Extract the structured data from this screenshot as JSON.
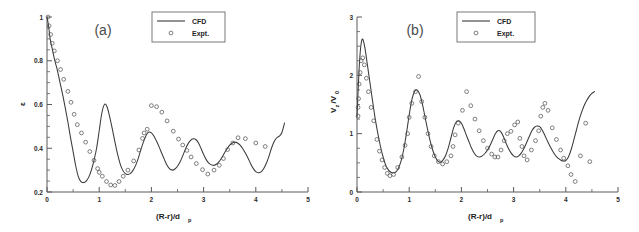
{
  "figure": {
    "title": "",
    "panels": [
      "a",
      "b"
    ]
  },
  "panel_a": {
    "label": "(a)",
    "legend": {
      "cfd_label": "CFD",
      "expt_label": "Expt."
    },
    "xlabel_main": "(R-r)/d",
    "xlabel_sub": "p",
    "ylabel": "ε"
  },
  "panel_b": {
    "label": "(b)",
    "legend": {
      "cfd_label": "CFD",
      "expt_label": "Expt."
    },
    "xlabel_main": "(R-r)/d",
    "xlabel_sub": "p",
    "ylabel_main": "V",
    "ylabel_sub1": "z",
    "ylabel_mid": "/V",
    "ylabel_sub2": "0"
  },
  "colors": {
    "curve": "#3a3a3a",
    "marker": "#555555",
    "axis": "#5a5a5a",
    "background": "#ffffff",
    "text": "#1f1f1f"
  },
  "chart_data": [
    {
      "type": "line",
      "panel": "a",
      "title": "(a)",
      "xlabel": "(R-r)/dp",
      "ylabel": "ε",
      "xlim": [
        0,
        5
      ],
      "ylim": [
        0.2,
        1.0
      ],
      "xticks": [
        0,
        1,
        2,
        3,
        4,
        5
      ],
      "yticks": [
        0.2,
        0.4,
        0.6,
        0.8,
        1.0
      ],
      "xticklabels": [
        "0",
        "1",
        "2",
        "3",
        "4",
        "5"
      ],
      "yticklabels": [
        "0.2",
        "0.4",
        "0.6",
        "0.8",
        "1"
      ],
      "xminor_step": 0.25,
      "yminor_step": 0.05,
      "grid": false,
      "legend_position": "top-right",
      "series": [
        {
          "name": "CFD",
          "style": "line",
          "x": [
            0.0,
            0.03,
            0.06,
            0.1,
            0.15,
            0.2,
            0.25,
            0.3,
            0.35,
            0.4,
            0.45,
            0.5,
            0.55,
            0.6,
            0.65,
            0.7,
            0.75,
            0.8,
            0.85,
            0.9,
            0.95,
            1.0,
            1.05,
            1.1,
            1.15,
            1.2,
            1.25,
            1.3,
            1.35,
            1.4,
            1.45,
            1.5,
            1.55,
            1.6,
            1.65,
            1.7,
            1.75,
            1.8,
            1.85,
            1.9,
            1.95,
            2.0,
            2.05,
            2.1,
            2.15,
            2.2,
            2.25,
            2.3,
            2.35,
            2.4,
            2.45,
            2.5,
            2.55,
            2.6,
            2.65,
            2.7,
            2.75,
            2.8,
            2.85,
            2.9,
            2.95,
            3.0,
            3.05,
            3.1,
            3.15,
            3.2,
            3.25,
            3.3,
            3.35,
            3.4,
            3.45,
            3.5,
            3.55,
            3.6,
            3.65,
            3.7,
            3.75,
            3.8,
            3.85,
            3.9,
            3.95,
            4.0,
            4.05,
            4.1,
            4.15,
            4.2,
            4.25,
            4.3,
            4.35,
            4.4,
            4.45,
            4.5,
            4.55
          ],
          "y": [
            1.0,
            0.96,
            0.9,
            0.855,
            0.8,
            0.755,
            0.7,
            0.645,
            0.585,
            0.52,
            0.45,
            0.385,
            0.32,
            0.27,
            0.247,
            0.243,
            0.25,
            0.268,
            0.3,
            0.345,
            0.4,
            0.48,
            0.56,
            0.6,
            0.59,
            0.545,
            0.49,
            0.43,
            0.375,
            0.33,
            0.3,
            0.284,
            0.28,
            0.285,
            0.3,
            0.323,
            0.355,
            0.395,
            0.43,
            0.46,
            0.474,
            0.47,
            0.455,
            0.432,
            0.405,
            0.376,
            0.348,
            0.322,
            0.306,
            0.3,
            0.305,
            0.318,
            0.338,
            0.365,
            0.395,
            0.42,
            0.436,
            0.443,
            0.44,
            0.425,
            0.4,
            0.372,
            0.348,
            0.332,
            0.324,
            0.322,
            0.328,
            0.34,
            0.358,
            0.378,
            0.398,
            0.414,
            0.424,
            0.428,
            0.424,
            0.414,
            0.398,
            0.378,
            0.355,
            0.33,
            0.308,
            0.293,
            0.288,
            0.292,
            0.306,
            0.33,
            0.362,
            0.4,
            0.43,
            0.448,
            0.455,
            0.472,
            0.515
          ]
        },
        {
          "name": "Expt.",
          "style": "markers",
          "x": [
            0.02,
            0.04,
            0.07,
            0.1,
            0.14,
            0.2,
            0.26,
            0.32,
            0.4,
            0.46,
            0.52,
            0.58,
            0.66,
            0.74,
            0.82,
            0.9,
            0.97,
            1.0,
            1.06,
            1.14,
            1.22,
            1.3,
            1.38,
            1.46,
            1.55,
            1.66,
            1.76,
            1.83,
            1.86,
            1.92,
            2.0,
            2.1,
            2.2,
            2.3,
            2.42,
            2.52,
            2.6,
            2.68,
            2.76,
            2.86,
            2.98,
            3.08,
            3.2,
            3.3,
            3.38,
            3.46,
            3.56,
            3.66,
            3.8,
            4.0,
            4.18
          ],
          "y": [
            1.0,
            0.96,
            0.92,
            0.88,
            0.845,
            0.8,
            0.76,
            0.715,
            0.66,
            0.61,
            0.555,
            0.508,
            0.47,
            0.428,
            0.385,
            0.345,
            0.307,
            0.29,
            0.272,
            0.248,
            0.232,
            0.23,
            0.248,
            0.272,
            0.3,
            0.342,
            0.392,
            0.445,
            0.47,
            0.487,
            0.595,
            0.59,
            0.565,
            0.525,
            0.478,
            0.442,
            0.415,
            0.39,
            0.36,
            0.33,
            0.302,
            0.282,
            0.3,
            0.322,
            0.353,
            0.394,
            0.424,
            0.448,
            0.444,
            0.424,
            0.408
          ]
        }
      ]
    },
    {
      "type": "line",
      "panel": "b",
      "title": "(b)",
      "xlabel": "(R-r)/dp",
      "ylabel": "Vz/V0",
      "xlim": [
        0,
        5
      ],
      "ylim": [
        0,
        3
      ],
      "xticks": [
        0,
        1,
        2,
        3,
        4,
        5
      ],
      "yticks": [
        0,
        1,
        2,
        3
      ],
      "xticklabels": [
        "0",
        "1",
        "2",
        "3",
        "4",
        "5"
      ],
      "yticklabels": [
        "0",
        "1",
        "2",
        "3"
      ],
      "xminor_step": 0.25,
      "yminor_step": 0.25,
      "grid": false,
      "legend_position": "top-right",
      "series": [
        {
          "name": "CFD",
          "style": "line",
          "x": [
            0.0,
            0.02,
            0.04,
            0.06,
            0.08,
            0.1,
            0.12,
            0.15,
            0.18,
            0.22,
            0.26,
            0.3,
            0.35,
            0.4,
            0.45,
            0.5,
            0.55,
            0.6,
            0.65,
            0.7,
            0.75,
            0.8,
            0.85,
            0.9,
            0.95,
            1.0,
            1.05,
            1.1,
            1.15,
            1.2,
            1.25,
            1.3,
            1.35,
            1.4,
            1.45,
            1.5,
            1.55,
            1.6,
            1.65,
            1.7,
            1.75,
            1.8,
            1.85,
            1.9,
            1.95,
            2.0,
            2.05,
            2.1,
            2.15,
            2.2,
            2.25,
            2.3,
            2.35,
            2.4,
            2.45,
            2.5,
            2.55,
            2.6,
            2.65,
            2.7,
            2.75,
            2.8,
            2.85,
            2.9,
            2.95,
            3.0,
            3.05,
            3.1,
            3.15,
            3.2,
            3.25,
            3.3,
            3.35,
            3.4,
            3.45,
            3.5,
            3.55,
            3.6,
            3.65,
            3.7,
            3.75,
            3.8,
            3.85,
            3.9,
            3.95,
            4.0,
            4.05,
            4.1,
            4.15,
            4.2,
            4.25,
            4.3,
            4.35,
            4.4,
            4.45,
            4.5,
            4.55
          ],
          "y": [
            1.3,
            1.7,
            2.1,
            2.38,
            2.55,
            2.62,
            2.6,
            2.48,
            2.3,
            2.05,
            1.8,
            1.55,
            1.25,
            1.0,
            0.78,
            0.6,
            0.46,
            0.38,
            0.34,
            0.33,
            0.35,
            0.42,
            0.55,
            0.75,
            1.02,
            1.32,
            1.58,
            1.72,
            1.75,
            1.68,
            1.52,
            1.3,
            1.08,
            0.88,
            0.72,
            0.6,
            0.53,
            0.51,
            0.55,
            0.63,
            0.76,
            0.93,
            1.1,
            1.2,
            1.22,
            1.18,
            1.08,
            0.96,
            0.85,
            0.74,
            0.66,
            0.61,
            0.6,
            0.62,
            0.66,
            0.72,
            0.8,
            0.9,
            1.0,
            1.05,
            1.04,
            0.96,
            0.85,
            0.75,
            0.67,
            0.62,
            0.6,
            0.62,
            0.67,
            0.75,
            0.85,
            0.95,
            1.05,
            1.11,
            1.13,
            1.12,
            1.06,
            0.97,
            0.87,
            0.78,
            0.7,
            0.63,
            0.58,
            0.55,
            0.53,
            0.54,
            0.6,
            0.72,
            0.88,
            1.05,
            1.22,
            1.36,
            1.48,
            1.57,
            1.64,
            1.69,
            1.72
          ]
        },
        {
          "name": "Expt.",
          "style": "markers",
          "x": [
            0.02,
            0.02,
            0.03,
            0.04,
            0.06,
            0.08,
            0.11,
            0.14,
            0.18,
            0.22,
            0.27,
            0.32,
            0.38,
            0.43,
            0.48,
            0.53,
            0.58,
            0.63,
            0.7,
            0.78,
            0.86,
            0.92,
            0.97,
            1.0,
            1.05,
            1.12,
            1.18,
            1.24,
            1.3,
            1.36,
            1.42,
            1.48,
            1.56,
            1.64,
            1.72,
            1.8,
            1.84,
            1.88,
            1.94,
            2.02,
            2.1,
            2.18,
            2.26,
            2.34,
            2.42,
            2.5,
            2.58,
            2.64,
            2.7,
            2.76,
            2.82,
            2.88,
            2.95,
            3.02,
            3.08,
            3.12,
            3.16,
            3.2,
            3.26,
            3.34,
            3.42,
            3.48,
            3.52,
            3.56,
            3.6,
            3.66,
            3.74,
            3.82,
            3.9,
            3.96,
            4.04,
            4.1,
            4.18,
            4.28,
            4.38,
            4.46
          ],
          "y": [
            1.3,
            1.45,
            1.6,
            1.85,
            2.05,
            2.25,
            2.3,
            2.18,
            1.95,
            1.72,
            1.45,
            1.22,
            0.9,
            0.7,
            0.55,
            0.42,
            0.32,
            0.28,
            0.3,
            0.42,
            0.6,
            0.8,
            1.0,
            1.28,
            1.52,
            1.72,
            1.98,
            1.55,
            1.28,
            1.0,
            0.78,
            0.62,
            0.52,
            0.48,
            0.52,
            0.62,
            0.78,
            0.98,
            1.18,
            1.4,
            1.72,
            1.48,
            1.25,
            1.05,
            0.88,
            0.75,
            0.65,
            0.6,
            0.6,
            0.72,
            0.88,
            1.0,
            1.04,
            1.15,
            1.2,
            0.92,
            0.78,
            0.62,
            0.55,
            0.72,
            0.88,
            1.05,
            1.3,
            1.45,
            1.52,
            1.4,
            1.1,
            0.9,
            0.72,
            0.58,
            0.45,
            0.3,
            0.18,
            0.62,
            1.18,
            0.52
          ]
        }
      ]
    }
  ]
}
